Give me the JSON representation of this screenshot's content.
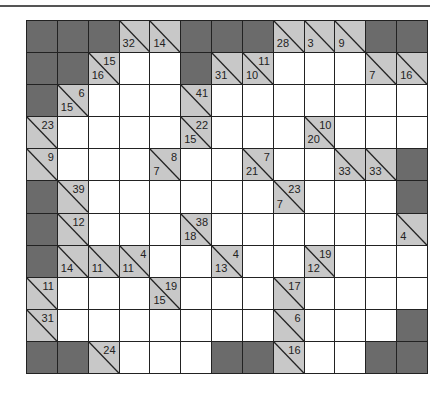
{
  "puzzle": {
    "type": "kakuro",
    "cols": 13,
    "rows": 11,
    "colors": {
      "block": "#6b6b6b",
      "clue": "#c8c8c8",
      "white": "#ffffff",
      "line": "#222222"
    },
    "grid": [
      [
        {
          "t": "B"
        },
        {
          "t": "B"
        },
        {
          "t": "B"
        },
        {
          "t": "C",
          "d": "32"
        },
        {
          "t": "C",
          "d": "14"
        },
        {
          "t": "B"
        },
        {
          "t": "B"
        },
        {
          "t": "B"
        },
        {
          "t": "C",
          "d": "28"
        },
        {
          "t": "C",
          "d": "3"
        },
        {
          "t": "C",
          "d": "9"
        },
        {
          "t": "B"
        },
        {
          "t": "B"
        }
      ],
      [
        {
          "t": "B"
        },
        {
          "t": "B"
        },
        {
          "t": "C",
          "d": "16",
          "r": "15"
        },
        {
          "t": "W"
        },
        {
          "t": "W"
        },
        {
          "t": "B"
        },
        {
          "t": "C",
          "d": "31"
        },
        {
          "t": "C",
          "d": "10",
          "r": "11"
        },
        {
          "t": "W"
        },
        {
          "t": "W"
        },
        {
          "t": "W"
        },
        {
          "t": "C",
          "d": "7"
        },
        {
          "t": "C",
          "d": "16"
        }
      ],
      [
        {
          "t": "B"
        },
        {
          "t": "C",
          "d": "15",
          "r": "6"
        },
        {
          "t": "W"
        },
        {
          "t": "W"
        },
        {
          "t": "W"
        },
        {
          "t": "C",
          "r": "41"
        },
        {
          "t": "W"
        },
        {
          "t": "W"
        },
        {
          "t": "W"
        },
        {
          "t": "W"
        },
        {
          "t": "W"
        },
        {
          "t": "W"
        },
        {
          "t": "W"
        }
      ],
      [
        {
          "t": "C",
          "r": "23"
        },
        {
          "t": "W"
        },
        {
          "t": "W"
        },
        {
          "t": "W"
        },
        {
          "t": "W"
        },
        {
          "t": "C",
          "d": "15",
          "r": "22"
        },
        {
          "t": "W"
        },
        {
          "t": "W"
        },
        {
          "t": "W"
        },
        {
          "t": "C",
          "d": "20",
          "r": "10"
        },
        {
          "t": "W"
        },
        {
          "t": "W"
        },
        {
          "t": "W"
        }
      ],
      [
        {
          "t": "C",
          "r": "9"
        },
        {
          "t": "W"
        },
        {
          "t": "W"
        },
        {
          "t": "W"
        },
        {
          "t": "C",
          "d": "7",
          "r": "8"
        },
        {
          "t": "W"
        },
        {
          "t": "W"
        },
        {
          "t": "C",
          "d": "21",
          "r": "7"
        },
        {
          "t": "W"
        },
        {
          "t": "W"
        },
        {
          "t": "C",
          "d": "33"
        },
        {
          "t": "C",
          "d": "33"
        },
        {
          "t": "B"
        }
      ],
      [
        {
          "t": "B"
        },
        {
          "t": "C",
          "r": "39"
        },
        {
          "t": "W"
        },
        {
          "t": "W"
        },
        {
          "t": "W"
        },
        {
          "t": "W"
        },
        {
          "t": "W"
        },
        {
          "t": "W"
        },
        {
          "t": "C",
          "d": "7",
          "r": "23"
        },
        {
          "t": "W"
        },
        {
          "t": "W"
        },
        {
          "t": "W"
        },
        {
          "t": "B"
        }
      ],
      [
        {
          "t": "B"
        },
        {
          "t": "C",
          "r": "12"
        },
        {
          "t": "W"
        },
        {
          "t": "W"
        },
        {
          "t": "W"
        },
        {
          "t": "C",
          "d": "18",
          "r": "38"
        },
        {
          "t": "W"
        },
        {
          "t": "W"
        },
        {
          "t": "W"
        },
        {
          "t": "W"
        },
        {
          "t": "W"
        },
        {
          "t": "W"
        },
        {
          "t": "C",
          "d": "4"
        }
      ],
      [
        {
          "t": "B"
        },
        {
          "t": "C",
          "d": "14"
        },
        {
          "t": "C",
          "d": "11"
        },
        {
          "t": "C",
          "d": "11",
          "r": "4"
        },
        {
          "t": "W"
        },
        {
          "t": "W"
        },
        {
          "t": "C",
          "d": "13",
          "r": "4"
        },
        {
          "t": "W"
        },
        {
          "t": "W"
        },
        {
          "t": "C",
          "d": "12",
          "r": "19"
        },
        {
          "t": "W"
        },
        {
          "t": "W"
        },
        {
          "t": "W"
        }
      ],
      [
        {
          "t": "C",
          "r": "11"
        },
        {
          "t": "W"
        },
        {
          "t": "W"
        },
        {
          "t": "W"
        },
        {
          "t": "C",
          "d": "15",
          "r": "19"
        },
        {
          "t": "W"
        },
        {
          "t": "W"
        },
        {
          "t": "W"
        },
        {
          "t": "C",
          "r": "17"
        },
        {
          "t": "W"
        },
        {
          "t": "W"
        },
        {
          "t": "W"
        },
        {
          "t": "W"
        }
      ],
      [
        {
          "t": "C",
          "r": "31"
        },
        {
          "t": "W"
        },
        {
          "t": "W"
        },
        {
          "t": "W"
        },
        {
          "t": "W"
        },
        {
          "t": "W"
        },
        {
          "t": "W"
        },
        {
          "t": "W"
        },
        {
          "t": "C",
          "r": "6"
        },
        {
          "t": "W"
        },
        {
          "t": "W"
        },
        {
          "t": "W"
        },
        {
          "t": "B"
        }
      ],
      [
        {
          "t": "B"
        },
        {
          "t": "B"
        },
        {
          "t": "C",
          "r": "24"
        },
        {
          "t": "W"
        },
        {
          "t": "W"
        },
        {
          "t": "W"
        },
        {
          "t": "B"
        },
        {
          "t": "B"
        },
        {
          "t": "C",
          "r": "16"
        },
        {
          "t": "W"
        },
        {
          "t": "W"
        },
        {
          "t": "B"
        },
        {
          "t": "B"
        }
      ]
    ]
  }
}
